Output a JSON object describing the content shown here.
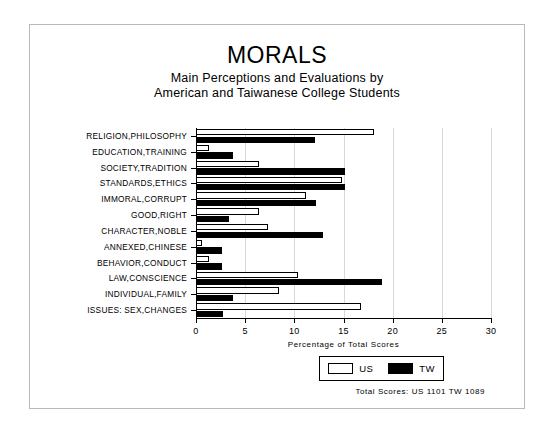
{
  "chart_data": {
    "type": "bar",
    "orientation": "horizontal",
    "title": "MORALS",
    "subtitle_line_1": "Main Perceptions and Evaluations by",
    "subtitle_line_2": "American and Taiwanese College Students",
    "xlabel": "Percentage of Total Scores",
    "ylabel": "",
    "xlim": [
      0,
      30
    ],
    "xticks": [
      0,
      5,
      10,
      15,
      20,
      25,
      30
    ],
    "xticklabels": [
      "0",
      "5",
      "10",
      "15",
      "20",
      "25",
      "30"
    ],
    "grid": true,
    "legend_position": "bottom-right",
    "categories": [
      "RELIGION,PHILOSOPHY",
      "EDUCATION,TRAINING",
      "SOCIETY,TRADITION",
      "STANDARDS,ETHICS",
      "IMMORAL,CORRUPT",
      "GOOD,RIGHT",
      "CHARACTER,NOBLE",
      "ANNEXED,CHINESE",
      "BEHAVIOR,CONDUCT",
      "LAW,CONSCIENCE",
      "INDIVIDUAL,FAMILY",
      "ISSUES: SEX,CHANGES"
    ],
    "series": [
      {
        "name": "US",
        "color": "#ffffff",
        "edgecolor": "#000000",
        "values": [
          18.1,
          1.3,
          6.4,
          14.8,
          11.2,
          6.4,
          7.3,
          0.6,
          1.3,
          10.4,
          8.4,
          16.8
        ]
      },
      {
        "name": "TW",
        "color": "#000000",
        "edgecolor": "#000000",
        "values": [
          12.1,
          3.8,
          15.2,
          15.2,
          12.2,
          3.4,
          12.9,
          2.6,
          2.6,
          18.9,
          3.8,
          2.7
        ]
      }
    ],
    "annotation": "Total Scores:  US 1101  TW 1089"
  },
  "legend": {
    "entries": [
      {
        "label": "US"
      },
      {
        "label": "TW"
      }
    ]
  }
}
